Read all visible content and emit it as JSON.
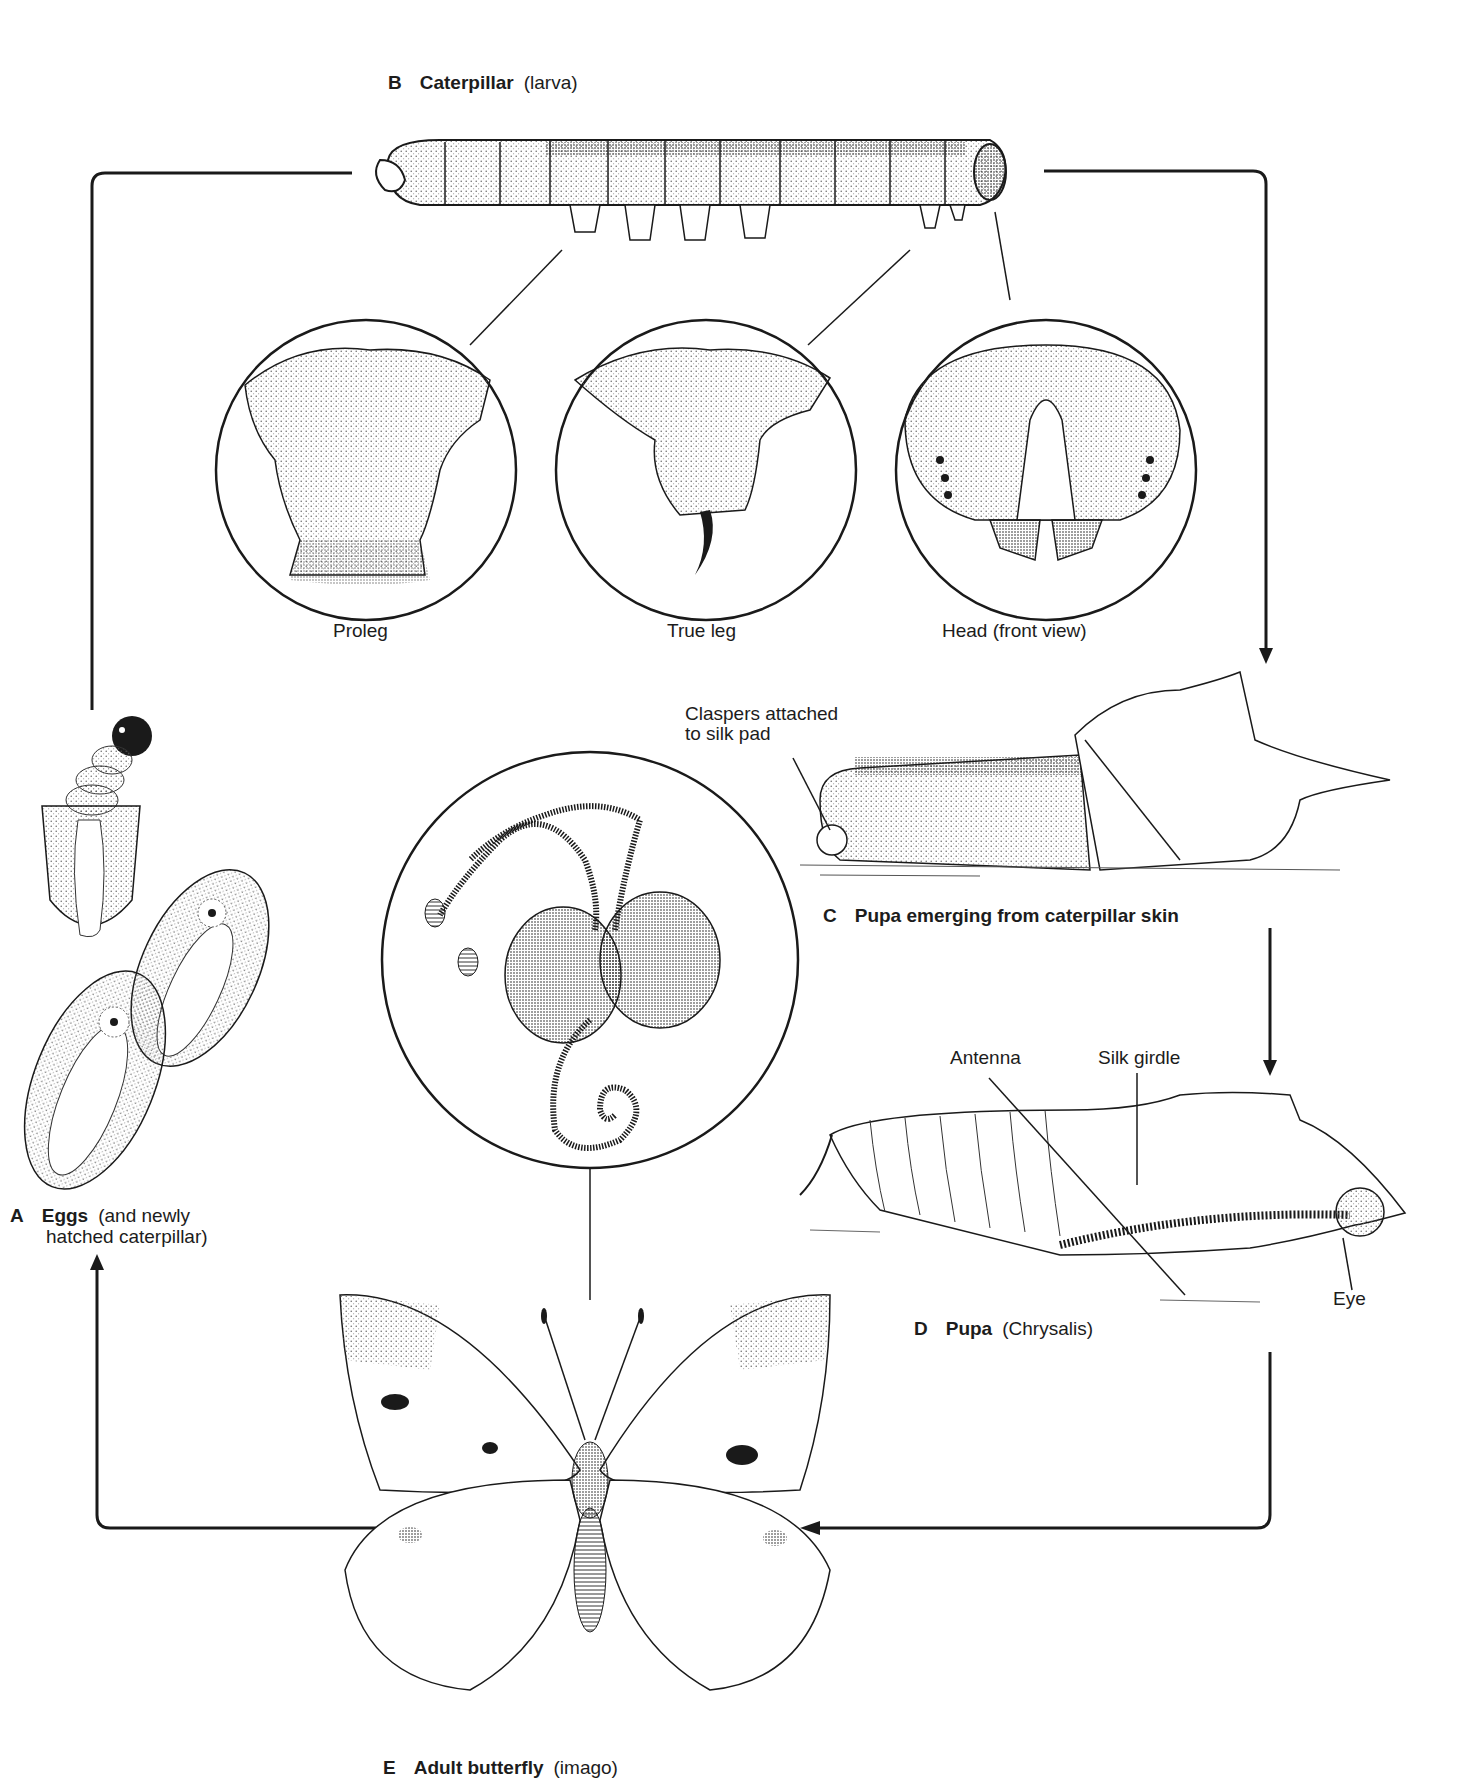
{
  "diagram": {
    "stages": [
      {
        "letter": "A",
        "name": "Eggs",
        "sub_line1": "(and newly",
        "sub_line2": "hatched caterpillar)"
      },
      {
        "letter": "B",
        "name": "Caterpillar",
        "sub": "(larva)"
      },
      {
        "letter": "C",
        "name": "Pupa emerging from caterpillar skin",
        "sub": ""
      },
      {
        "letter": "D",
        "name": "Pupa",
        "sub": "(Chrysalis)"
      },
      {
        "letter": "E",
        "name": "Adult butterfly",
        "sub": "(imago)"
      }
    ],
    "detail_labels": {
      "proleg": "Proleg",
      "true_leg": "True leg",
      "head": "Head (front view)",
      "claspers_line1": "Claspers attached",
      "claspers_line2": "to silk pad",
      "antenna": "Antenna",
      "silk_girdle": "Silk girdle",
      "eye": "Eye"
    },
    "arrows": [
      {
        "from": "A",
        "to": "B",
        "direction": "up-then-right"
      },
      {
        "from": "B",
        "to": "C",
        "direction": "right-then-down"
      },
      {
        "from": "C",
        "to": "D",
        "direction": "down"
      },
      {
        "from": "D",
        "to": "E",
        "direction": "down-then-left"
      },
      {
        "from": "E",
        "to": "A",
        "direction": "left-then-up"
      }
    ],
    "colors": {
      "ink": "#1a1a1a",
      "paper": "#ffffff",
      "stipple": "#8a8a8a"
    }
  }
}
